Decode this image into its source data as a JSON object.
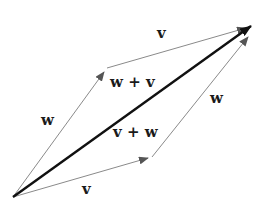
{
  "diagram": {
    "type": "vector-parallelogram",
    "colors": {
      "thin_edge": "#8a8a8a",
      "sum_vector": "#111111",
      "text": "#1a1a1a",
      "background": "#ffffff"
    },
    "points": {
      "origin": [
        13,
        197
      ],
      "w_end": [
        107,
        68
      ],
      "v_end": [
        152,
        157
      ],
      "sum_end": [
        252,
        25
      ]
    },
    "labels": {
      "v_top": "v",
      "w_left": "w",
      "w_plus_v": "w + v",
      "v_plus_w": "v + w",
      "w_right": "w",
      "v_bottom": "v"
    }
  }
}
